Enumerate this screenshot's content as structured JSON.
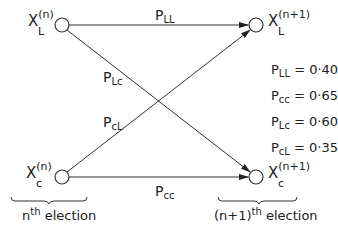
{
  "diagram": {
    "nodes": {
      "left_top": {
        "symbol": "X",
        "subscript": "L",
        "superscript": "(n)"
      },
      "left_bottom": {
        "symbol": "X",
        "subscript": "c",
        "superscript": "(n)"
      },
      "right_top": {
        "symbol": "X",
        "subscript": "L",
        "superscript": "(n+1)"
      },
      "right_bottom": {
        "symbol": "X",
        "subscript": "c",
        "superscript": "(n+1)"
      }
    },
    "edges": {
      "LL": {
        "symbol": "P",
        "subscript": "LL"
      },
      "Lc": {
        "symbol": "P",
        "subscript": "Lc"
      },
      "cL": {
        "symbol": "P",
        "subscript": "cL"
      },
      "cc": {
        "symbol": "P",
        "subscript": "cc"
      }
    },
    "values": [
      {
        "symbol": "P",
        "subscript": "LL",
        "value": "= 0·40"
      },
      {
        "symbol": "P",
        "subscript": "cc",
        "value": "= 0·65"
      },
      {
        "symbol": "P",
        "subscript": "Lc",
        "value": "= 0·60"
      },
      {
        "symbol": "P",
        "subscript": "cL",
        "value": "= 0·35"
      }
    ],
    "braces": {
      "left": {
        "prefix": "n",
        "sup": "th",
        "label": "election"
      },
      "right": {
        "prefix": "(n+1)",
        "sup": "th",
        "label": "election"
      }
    },
    "line_color": "#333333"
  }
}
